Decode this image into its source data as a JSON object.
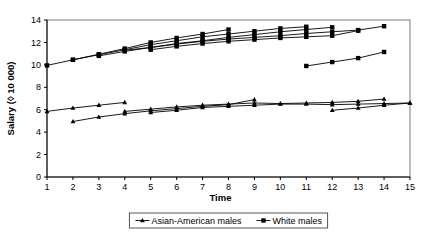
{
  "chart_data": {
    "type": "line",
    "title": "",
    "xlabel": "Time",
    "ylabel": "Salary (◊ 10 000)",
    "xlim": [
      1,
      15
    ],
    "ylim": [
      0,
      14
    ],
    "xticks": [
      1,
      2,
      3,
      4,
      5,
      6,
      7,
      8,
      9,
      10,
      11,
      12,
      13,
      14,
      15
    ],
    "yticks": [
      0,
      2,
      4,
      6,
      8,
      10,
      12,
      14
    ],
    "grid": false,
    "legend_position": "bottom-center",
    "marker_white": "square",
    "marker_asian": "triangle",
    "legend": [
      {
        "label": "Asian-American males",
        "marker": "triangle"
      },
      {
        "label": "White males",
        "marker": "square"
      }
    ],
    "series": [
      {
        "name": "Asian-American males",
        "group": "asian",
        "marker": "triangle",
        "cohorts": [
          {
            "x": [
              1,
              2,
              3,
              4
            ],
            "y": [
              5.85,
              6.15,
              6.4,
              6.65
            ]
          },
          {
            "x": [
              2,
              3,
              4,
              5,
              6,
              7,
              8,
              9
            ],
            "y": [
              4.95,
              5.35,
              5.65,
              5.9,
              6.1,
              6.3,
              6.45,
              6.9
            ]
          },
          {
            "x": [
              4,
              5,
              6,
              7,
              8,
              9,
              10,
              11,
              12,
              13,
              14
            ],
            "y": [
              5.85,
              6.05,
              6.25,
              6.4,
              6.5,
              6.6,
              6.55,
              6.6,
              6.65,
              6.75,
              6.95
            ]
          },
          {
            "x": [
              5,
              6,
              7,
              8,
              9,
              10,
              11,
              12,
              13,
              14,
              15
            ],
            "y": [
              5.75,
              5.95,
              6.2,
              6.3,
              6.4,
              6.5,
              6.5,
              6.45,
              6.5,
              6.55,
              6.6
            ]
          },
          {
            "x": [
              12,
              13,
              14,
              15
            ],
            "y": [
              5.95,
              6.15,
              6.4,
              6.6
            ]
          }
        ]
      },
      {
        "name": "White males",
        "group": "white",
        "marker": "square",
        "cohorts": [
          {
            "x": [
              1,
              2,
              3,
              4,
              5,
              6,
              7,
              8
            ],
            "y": [
              9.95,
              10.45,
              10.95,
              11.45,
              12.0,
              12.4,
              12.75,
              13.15
            ]
          },
          {
            "x": [
              2,
              3,
              4,
              5,
              6,
              7,
              8,
              9,
              10,
              11
            ],
            "y": [
              10.45,
              10.9,
              11.35,
              11.8,
              12.15,
              12.5,
              12.75,
              13.0,
              13.25,
              13.4
            ]
          },
          {
            "x": [
              3,
              4,
              5,
              6,
              7,
              8,
              9,
              10,
              11,
              12
            ],
            "y": [
              10.8,
              11.2,
              11.55,
              11.9,
              12.15,
              12.45,
              12.7,
              12.95,
              13.15,
              13.35
            ]
          },
          {
            "x": [
              4,
              5,
              6,
              7,
              8,
              9,
              10,
              11,
              12,
              13,
              14
            ],
            "y": [
              11.3,
              11.55,
              11.85,
              12.1,
              12.3,
              12.45,
              12.6,
              12.8,
              12.95,
              13.1,
              13.45
            ]
          },
          {
            "x": [
              5,
              6,
              7,
              8,
              9,
              10,
              11,
              12,
              13
            ],
            "y": [
              11.35,
              11.65,
              11.9,
              12.1,
              12.25,
              12.4,
              12.5,
              12.6,
              13.05
            ]
          },
          {
            "x": [
              11,
              12,
              13,
              14
            ],
            "y": [
              9.9,
              10.25,
              10.6,
              11.15
            ]
          }
        ]
      }
    ]
  }
}
